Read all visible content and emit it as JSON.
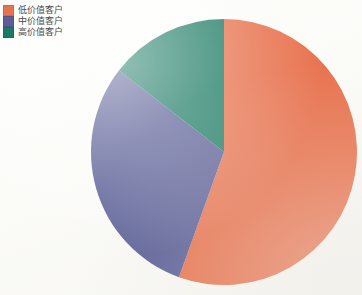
{
  "chart_data": {
    "type": "pie",
    "title": "",
    "subtitle": "",
    "xlabel": "",
    "ylabel": "",
    "legend_position": "top-left",
    "grid": false,
    "categories": [
      "低价值客户",
      "中价值客户",
      "高价值客户"
    ],
    "values": [
      55.5,
      30.0,
      14.5
    ],
    "colors": [
      "#e8734f",
      "#5b5f96",
      "#1b7a63"
    ],
    "start_angle_deg": 0,
    "direction": "clockwise",
    "slices": [
      {
        "label": "低价值客户",
        "value": 55.5,
        "color": "#e8734f",
        "start_angle_deg": 0,
        "end_angle_deg": 199.8
      },
      {
        "label": "中价值客户",
        "value": 30.0,
        "color": "#5b5f96",
        "start_angle_deg": 199.8,
        "end_angle_deg": 307.8
      },
      {
        "label": "高价值客户",
        "value": 14.5,
        "color": "#1b7a63",
        "start_angle_deg": 307.8,
        "end_angle_deg": 360
      }
    ]
  },
  "legend": {
    "items": [
      {
        "label": "低价值客户",
        "color": "#e8734f",
        "swatch_name": "legend-swatch-low-value"
      },
      {
        "label": "中价值客户",
        "color": "#5b5f96",
        "swatch_name": "legend-swatch-medium-value"
      },
      {
        "label": "高价值客户",
        "color": "#1b7a63",
        "swatch_name": "legend-swatch-high-value"
      }
    ]
  },
  "geometry": {
    "center_x": 224,
    "center_y": 152,
    "radius": 133
  }
}
